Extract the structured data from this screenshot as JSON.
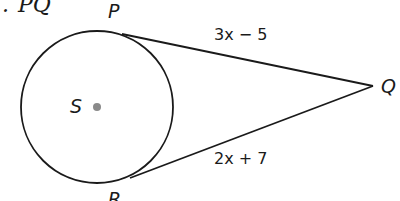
{
  "prompt": {
    "bullet": ".",
    "text": "PQ"
  },
  "circle": {
    "center_label": "S",
    "center": [
      97,
      107
    ],
    "radius": 76,
    "center_dot_color": "#8a8a8a"
  },
  "points": {
    "P": {
      "label": "P",
      "pos": [
        128,
        32
      ]
    },
    "Q": {
      "label": "Q",
      "pos": [
        373,
        86
      ]
    },
    "R": {
      "label": "R",
      "pos": [
        130,
        181
      ]
    }
  },
  "segments": {
    "PQ": {
      "expression": "3x − 5"
    },
    "RQ": {
      "expression": "2x + 7"
    }
  },
  "colors": {
    "stroke": "#1a1a1a",
    "background": "#ffffff"
  }
}
